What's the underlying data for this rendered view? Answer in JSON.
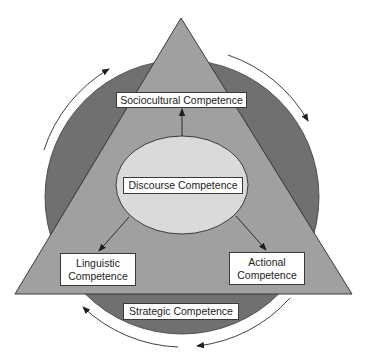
{
  "diagram": {
    "type": "communicative-competence-model",
    "colors": {
      "background": "#ffffff",
      "outer_circle": "#707070",
      "triangle": "#a0a0a0",
      "center_ellipse": "#dadada",
      "label_box_fill": "#ffffff",
      "stroke": "#2a2a2a"
    },
    "labels": {
      "sociocultural": "Sociocultural Competence",
      "discourse": "Discourse Competence",
      "linguistic_line1": "Linguistic",
      "linguistic_line2": "Competence",
      "actional_line1": "Actional",
      "actional_line2": "Competence",
      "strategic": "Strategic Competence"
    },
    "arrows": [
      {
        "from": "Discourse Competence",
        "to": "Sociocultural Competence"
      },
      {
        "from": "Discourse Competence",
        "to": "Linguistic Competence"
      },
      {
        "from": "Discourse Competence",
        "to": "Actional Competence"
      }
    ],
    "circular_arrows": {
      "count": 4,
      "direction": "clockwise"
    }
  }
}
